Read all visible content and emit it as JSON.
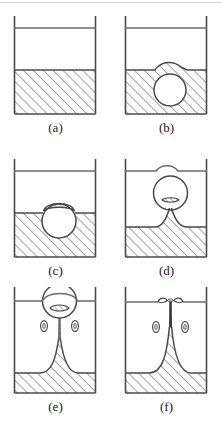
{
  "figure": {
    "panel_count": 6,
    "colors": {
      "outline": "#4a4a4a",
      "hatch": "#555555",
      "liquid_fill": "#ffffff",
      "background": "#ffffff",
      "caption_text": "#1a1a1a",
      "top_rule": "#d8d8d8"
    },
    "panels": [
      {
        "id": "a",
        "caption": "(a)",
        "description": "Container with flat liquid surface and hatched liquid body at rest",
        "surface_level": 62,
        "has_bubble": false,
        "has_jet": false,
        "has_droplets": false,
        "droplet_count": 0
      },
      {
        "id": "b",
        "caption": "(b)",
        "description": "Bubble submerged just below the surface causing a slight bulge",
        "surface_level": 62,
        "has_bubble": true,
        "bubble_center_y": 82,
        "bubble_radius": 16,
        "has_jet": false,
        "has_droplets": false,
        "droplet_count": 0
      },
      {
        "id": "c",
        "caption": "(c)",
        "description": "Bubble straddling the surface covered by a thin liquid film",
        "surface_level": 62,
        "has_bubble": true,
        "bubble_center_y": 70,
        "bubble_radius": 17,
        "has_jet": false,
        "has_droplets": false,
        "droplet_count": 0
      },
      {
        "id": "d",
        "caption": "(d)",
        "description": "Bubble detaching above the surface drawing a narrow neck from the liquid cone",
        "surface_level": 76,
        "has_bubble": true,
        "bubble_center_y": 42,
        "bubble_radius": 17,
        "has_jet": true,
        "has_droplets": false,
        "droplet_count": 0
      },
      {
        "id": "e",
        "caption": "(e)",
        "description": "Long thin jet stretching from the liquid cone to the bubble with two satellite droplets",
        "surface_level": 86,
        "has_bubble": true,
        "bubble_center_y": 14,
        "bubble_radius": 17,
        "has_jet": true,
        "has_droplets": true,
        "droplet_count": 2
      },
      {
        "id": "f",
        "caption": "(f)",
        "description": "Jet reaching the upper surface and spreading into lobes with two satellite droplets",
        "surface_level": 86,
        "has_bubble": false,
        "has_jet": true,
        "has_droplets": true,
        "droplet_count": 2
      }
    ]
  }
}
